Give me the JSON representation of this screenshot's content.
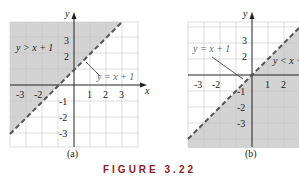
{
  "figure": {
    "title": "FIGURE 3.22",
    "panels": [
      {
        "id": "a",
        "caption": "(a)",
        "shaded_region": "y > x + 1",
        "boundary_label": "y = x + 1",
        "boundary": "dashed",
        "x_ticks": [
          "-3",
          "-2",
          "1",
          "2",
          "3"
        ],
        "y_ticks": [
          "3",
          "2",
          "-1",
          "-2",
          "-3"
        ],
        "x_axis_label": "x",
        "y_axis_label": "y"
      },
      {
        "id": "b",
        "caption": "(b)",
        "shaded_region": "y < x + 1",
        "boundary_label": "y = x + 1",
        "boundary": "dashed",
        "x_ticks": [
          "-3",
          "-2",
          "1",
          "2"
        ],
        "y_ticks": [
          "3",
          "2",
          "-1",
          "-2",
          "-3"
        ],
        "x_axis_label": "",
        "y_axis_label": "y"
      }
    ],
    "colors": {
      "shade": "#d3d3d3",
      "grid": "#c8c8c8",
      "axis": "#222222",
      "dash": "#555555",
      "title": "#8a2020"
    }
  }
}
